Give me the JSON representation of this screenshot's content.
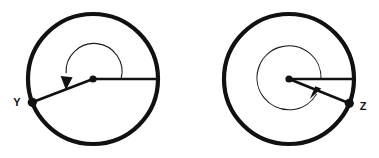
{
  "figure": {
    "background_color": "#ffffff",
    "stroke_color": "#111111",
    "width": 379,
    "height": 158,
    "diagrams": [
      {
        "id": "left-circle",
        "label": "Y",
        "label_text": "Y",
        "label_x": 17,
        "label_y": 103,
        "center_x": 93,
        "center_y": 79,
        "radius": 65,
        "outline_width": 4.2,
        "center_dot_r": 3.6,
        "vertex_dot_r": 4.6,
        "vertex_angle_deg": 201,
        "vertex_x": 32.3,
        "vertex_y": 102.3,
        "initial_ray_angle_deg": 0,
        "initial_ray_x": 158,
        "initial_ray_y": 79,
        "radius_line_width": 2.6,
        "arc_radius": 28,
        "arc_start_deg": 0,
        "arc_end_deg": 196,
        "arc_direction": "counterclockwise",
        "arrow_tip_x": 66.3,
        "arrow_tip_y": 87.6,
        "arrow_angle_deg": 196
      },
      {
        "id": "right-circle",
        "label": "Z",
        "label_text": "Z",
        "label_x": 361,
        "label_y": 107,
        "center_x": 289,
        "center_y": 79,
        "radius": 65,
        "outline_width": 4.2,
        "center_dot_r": 3.6,
        "vertex_dot_r": 4.6,
        "vertex_angle_deg": -22,
        "vertex_x": 349.3,
        "vertex_y": 103.3,
        "initial_ray_angle_deg": 0,
        "initial_ray_x": 354,
        "initial_ray_y": 79,
        "radius_line_width": 2.6,
        "arc_radius": 32,
        "arc_start_deg": 0,
        "arc_end_deg": 332,
        "arc_direction": "counterclockwise",
        "arrow_tip_x": 317.2,
        "arrow_tip_y": 94.0,
        "arrow_angle_deg": 332
      }
    ]
  }
}
